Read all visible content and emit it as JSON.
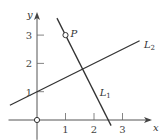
{
  "chart_data": {
    "type": "line",
    "title": "",
    "xlabel": "x",
    "ylabel": "y",
    "xlim": [
      -1.0,
      4.0
    ],
    "ylim": [
      -0.7,
      3.9
    ],
    "xticks": [
      1,
      2,
      3
    ],
    "yticks": [
      1,
      2,
      3
    ],
    "xtick_labels": [
      "1",
      "2",
      "3"
    ],
    "ytick_labels": [
      "1",
      "2",
      "3"
    ],
    "grid": false,
    "series": [
      {
        "name": "L1",
        "label": "L",
        "subscript": "1",
        "equation": "y = -2x + 5",
        "x": [
          0.7,
          2.6
        ],
        "y": [
          3.6,
          -0.2
        ],
        "label_at": [
          2.2,
          1.0
        ]
      },
      {
        "name": "L2",
        "label": "L",
        "subscript": "2",
        "equation": "y = 0.5x + 1",
        "x": [
          -0.95,
          3.6
        ],
        "y": [
          0.52,
          2.8
        ],
        "label_at": [
          3.75,
          2.7
        ]
      }
    ],
    "points": [
      {
        "name": "P",
        "label": "P",
        "x": 1,
        "y": 3,
        "style": "open-circle"
      },
      {
        "name": "origin",
        "label": "",
        "x": 0,
        "y": 0,
        "style": "open-circle"
      }
    ]
  }
}
